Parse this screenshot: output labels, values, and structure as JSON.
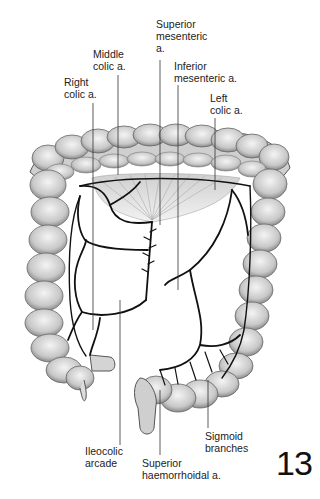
{
  "figure": {
    "number": "13"
  },
  "labels": {
    "superior_mesenteric": "Superior\nmesenteric\na.",
    "middle_colic": "Middle\ncolic a.",
    "right_colic": "Right\ncolic a.",
    "inferior_mesenteric": "Inferior\nmesenteric a.",
    "left_colic": "Left\ncolic a.",
    "ileocolic_arcade": "Ileocolic\narcade",
    "superior_haemorrhoidal": "Superior\nhaemorrhoidal a.",
    "sigmoid_branches": "Sigmoid\nbranches"
  },
  "colors": {
    "background": "#ffffff",
    "text": "#222222",
    "vessel": "#111111",
    "colon_fill": "#d8d8d8",
    "colon_shade": "#9a9a9a",
    "leader_line": "#333333"
  }
}
